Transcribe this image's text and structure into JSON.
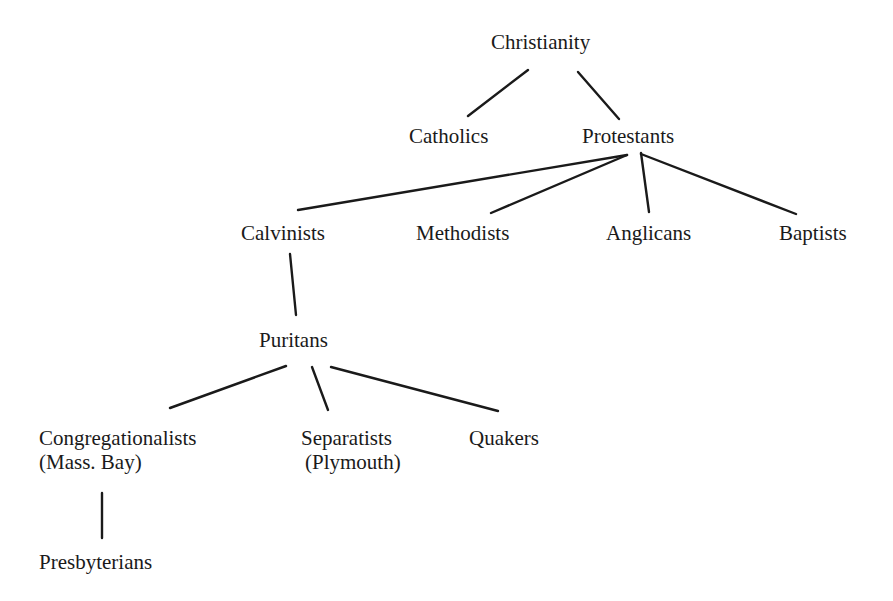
{
  "diagram": {
    "type": "tree",
    "title": "",
    "colors": {
      "line": "#1a1a1a",
      "text": "#1a1a1a",
      "background": "#ffffff"
    },
    "nodes": {
      "christianity": {
        "label": "Christianity"
      },
      "catholics": {
        "label": "Catholics"
      },
      "protestants": {
        "label": "Protestants"
      },
      "calvinists": {
        "label": "Calvinists"
      },
      "methodists": {
        "label": "Methodists"
      },
      "anglicans": {
        "label": "Anglicans"
      },
      "baptists": {
        "label": "Baptists"
      },
      "puritans": {
        "label": "Puritans"
      },
      "congregationalists": {
        "label": "Congregationalists",
        "sublabel": "(Mass. Bay)"
      },
      "separatists": {
        "label": "Separatists",
        "sublabel": "(Plymouth)"
      },
      "quakers": {
        "label": "Quakers"
      },
      "presbyterians": {
        "label": "Presbyterians"
      }
    },
    "edges": [
      [
        "Christianity",
        "Catholics"
      ],
      [
        "Christianity",
        "Protestants"
      ],
      [
        "Protestants",
        "Calvinists"
      ],
      [
        "Protestants",
        "Methodists"
      ],
      [
        "Protestants",
        "Anglicans"
      ],
      [
        "Protestants",
        "Baptists"
      ],
      [
        "Calvinists",
        "Puritans"
      ],
      [
        "Puritans",
        "Congregationalists (Mass. Bay)"
      ],
      [
        "Puritans",
        "Separatists (Plymouth)"
      ],
      [
        "Puritans",
        "Quakers"
      ],
      [
        "Congregationalists (Mass. Bay)",
        "Presbyterians"
      ]
    ]
  }
}
